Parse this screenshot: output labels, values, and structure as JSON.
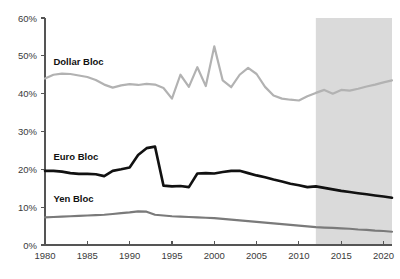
{
  "chart_data": {
    "type": "line",
    "title": "",
    "subtitle": "",
    "xlabel": "",
    "ylabel": "",
    "xlim": [
      1980,
      2021
    ],
    "ylim": [
      0,
      60
    ],
    "grid": false,
    "legend_position": "inline-labels",
    "x_tick_labels": [
      "1980",
      "1985",
      "1990",
      "1995",
      "2000",
      "2005",
      "2010",
      "2015",
      "2020"
    ],
    "x_ticks": [
      1980,
      1985,
      1990,
      1995,
      2000,
      2005,
      2010,
      2015,
      2020
    ],
    "y_tick_labels": [
      "0%",
      "10%",
      "20%",
      "30%",
      "40%",
      "50%",
      "60%"
    ],
    "y_ticks": [
      0,
      10,
      20,
      30,
      40,
      50,
      60
    ],
    "y_unit": "%",
    "annotations": [
      {
        "name": "forecast-band",
        "label": "",
        "x_start": 2012,
        "x_end": 2021,
        "fill": "#d8d8d8"
      }
    ],
    "x": [
      1980,
      1981,
      1982,
      1983,
      1984,
      1985,
      1986,
      1987,
      1988,
      1989,
      1990,
      1991,
      1992,
      1993,
      1994,
      1995,
      1996,
      1997,
      1998,
      1999,
      2000,
      2001,
      2002,
      2003,
      2004,
      2005,
      2006,
      2007,
      2008,
      2009,
      2010,
      2011,
      2012,
      2013,
      2014,
      2015,
      2016,
      2017,
      2018,
      2019,
      2020,
      2021
    ],
    "series": [
      {
        "name": "Dollar Bloc",
        "label": "Dollar Bloc",
        "color": "#b2b2b2",
        "stroke_width": 2.2,
        "label_x": 1981,
        "label_y": 47.5,
        "values": [
          44.0,
          45.0,
          45.3,
          45.2,
          44.8,
          44.4,
          43.6,
          42.4,
          41.6,
          42.2,
          42.5,
          42.3,
          42.6,
          42.4,
          41.5,
          38.7,
          45.0,
          41.8,
          47.0,
          42.0,
          52.5,
          43.5,
          41.7,
          45.0,
          46.8,
          45.2,
          41.8,
          39.5,
          38.7,
          38.4,
          38.2,
          39.3,
          40.2,
          41.0,
          40.0,
          41.0,
          40.8,
          41.3,
          41.9,
          42.4,
          43.0,
          43.5
        ]
      },
      {
        "name": "Euro Bloc",
        "label": "Euro Bloc",
        "color": "#111111",
        "stroke_width": 2.6,
        "label_x": 1981,
        "label_y": 22.4,
        "values": [
          19.6,
          19.6,
          19.4,
          19.0,
          18.8,
          18.8,
          18.7,
          18.2,
          19.6,
          20.0,
          20.5,
          23.8,
          25.6,
          26.0,
          15.7,
          15.5,
          15.6,
          15.3,
          18.9,
          19.0,
          18.9,
          19.3,
          19.6,
          19.6,
          19.0,
          18.4,
          17.9,
          17.3,
          16.8,
          16.2,
          15.8,
          15.3,
          15.5,
          15.1,
          14.7,
          14.3,
          14.0,
          13.7,
          13.4,
          13.1,
          12.8,
          12.5
        ]
      },
      {
        "name": "Yen Bloc",
        "label": "Yen Bloc",
        "color": "#7a7a7a",
        "stroke_width": 2.2,
        "label_x": 1981,
        "label_y": 11.4,
        "values": [
          7.3,
          7.4,
          7.5,
          7.6,
          7.7,
          7.8,
          7.9,
          8.0,
          8.2,
          8.4,
          8.6,
          8.9,
          8.8,
          8.0,
          7.8,
          7.6,
          7.5,
          7.4,
          7.3,
          7.2,
          7.1,
          6.9,
          6.7,
          6.5,
          6.3,
          6.1,
          5.9,
          5.7,
          5.5,
          5.3,
          5.1,
          4.9,
          4.7,
          4.6,
          4.5,
          4.4,
          4.3,
          4.1,
          4.0,
          3.8,
          3.7,
          3.5
        ]
      }
    ]
  }
}
